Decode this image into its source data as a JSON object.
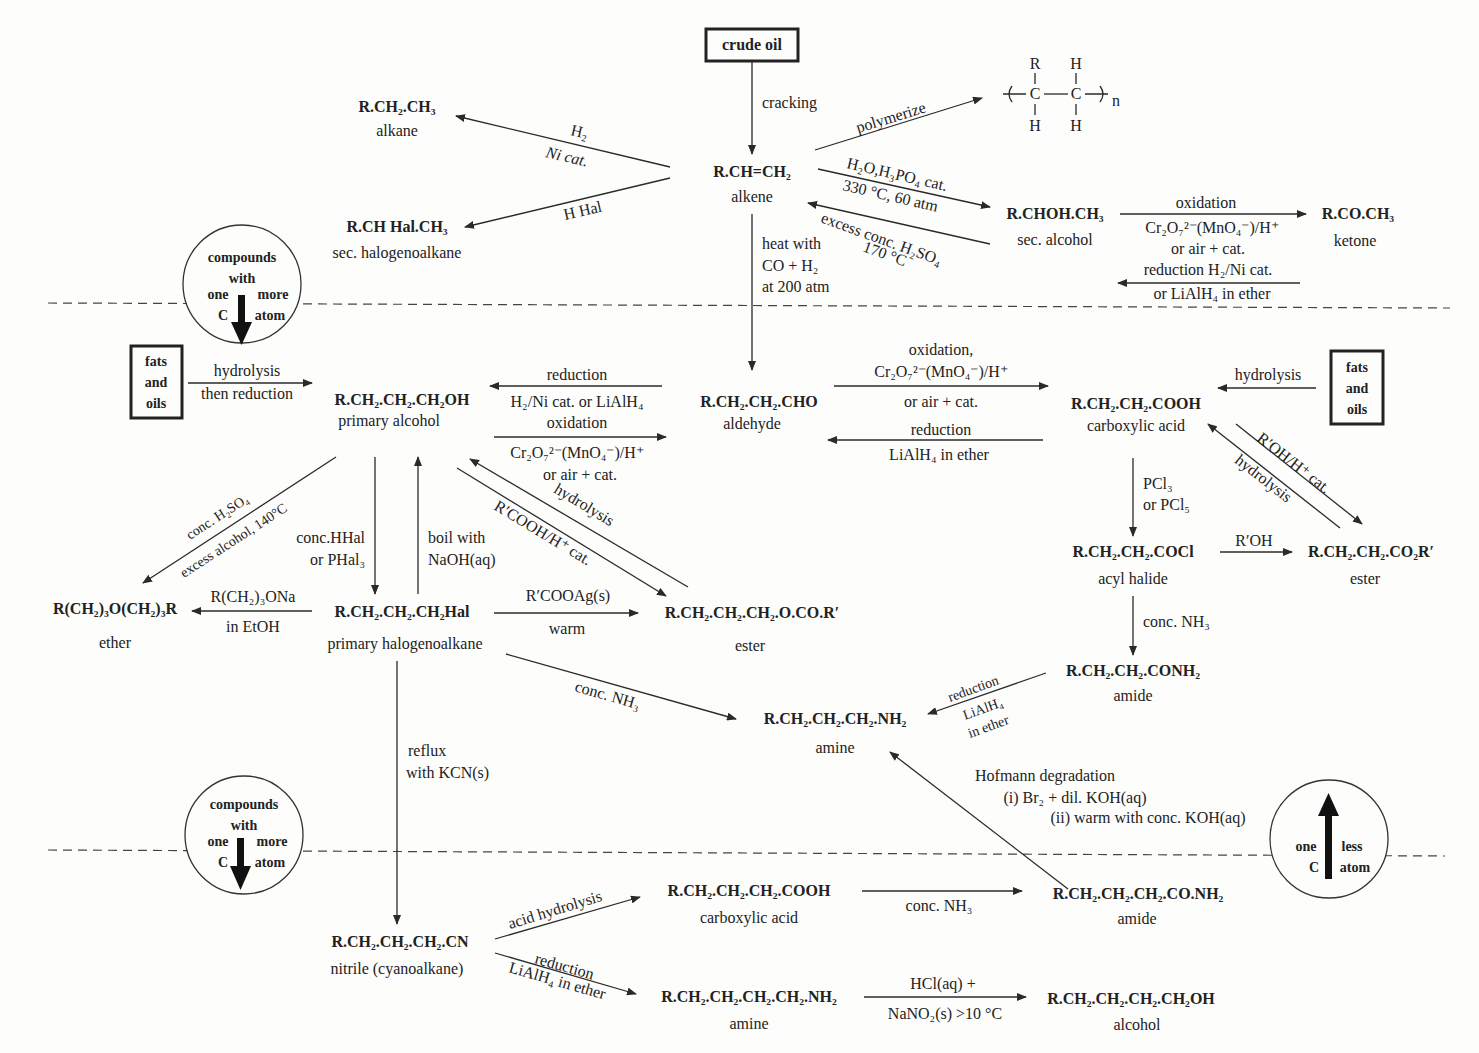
{
  "sources": {
    "crude_oil": "crude oil",
    "fats_oils_left": [
      "fats",
      "and",
      "oils"
    ],
    "fats_oils_right": [
      "fats",
      "and",
      "oils"
    ]
  },
  "compounds": {
    "alkene": {
      "formula": "R.CH=CH₂",
      "name": "alkene"
    },
    "alkane": {
      "formula": "R.CH₂.CH₃",
      "name": "alkane"
    },
    "sec_haloalkane": {
      "formula": "R.CH Hal.CH₃",
      "name": "sec. halogenoalkane"
    },
    "polymer": {
      "top": [
        "R",
        "H"
      ],
      "mid": "—C—C—",
      "bottom": [
        "H",
        "H"
      ],
      "n": "n"
    },
    "sec_alcohol": {
      "formula": "R.CHOH.CH₃",
      "name": "sec. alcohol"
    },
    "ketone": {
      "formula": "R.CO.CH₃",
      "name": "ketone"
    },
    "primary_alcohol": {
      "formula": "R.CH₂.CH₂.CH₂OH",
      "name": "primary alcohol"
    },
    "aldehyde": {
      "formula": "R.CH₂.CH₂.CHO",
      "name": "aldehyde"
    },
    "carboxylic_acid": {
      "formula": "R.CH₂.CH₂.COOH",
      "name": "carboxylic acid"
    },
    "ether": {
      "formula": "R(CH₂)₃O(CH₂)₃R",
      "name": "ether"
    },
    "primary_haloalkane": {
      "formula": "R.CH₂.CH₂.CH₂Hal",
      "name": "primary halogenoalkane"
    },
    "ester_left": {
      "formula": "R.CH₂.CH₂.CH₂.O.CO.R′",
      "name": "ester"
    },
    "acyl_halide": {
      "formula": "R.CH₂.CH₂.COCl",
      "name": "acyl halide"
    },
    "ester_right": {
      "formula": "R.CH₂.CH₂.CO₂R′",
      "name": "ester"
    },
    "amide_mid": {
      "formula": "R.CH₂.CH₂.CONH₂",
      "name": "amide"
    },
    "amine_mid": {
      "formula": "R.CH₂.CH₂.CH₂.NH₂",
      "name": "amine"
    },
    "nitrile": {
      "formula": "R.CH₂.CH₂.CH₂.CN",
      "name": "nitrile (cyanoalkane)"
    },
    "carboxylic_acid_low": {
      "formula": "R.CH₂.CH₂.CH₂.COOH",
      "name": "carboxylic acid"
    },
    "amide_low": {
      "formula": "R.CH₂.CH₂.CH₂.CO.NH₂",
      "name": "amide"
    },
    "amine_low": {
      "formula": "R.CH₂.CH₂.CH₂.CH₂.NH₂",
      "name": "amine"
    },
    "alcohol_low": {
      "formula": "R.CH₂.CH₂.CH₂.CH₂OH",
      "name": "alcohol"
    }
  },
  "reactions": {
    "cracking": "cracking",
    "polymerize": "polymerize",
    "hydrogenation": [
      "H₂",
      "Ni cat."
    ],
    "hhal": "H Hal",
    "hydration": [
      "H₂O,H₃PO₄ cat.",
      "330 °C, 60 atm"
    ],
    "dehydration": [
      "excess conc. H₂SO₄",
      "170 °C"
    ],
    "sec_oxidation": [
      "oxidation",
      "Cr₂O₇²⁻(MnO₄⁻)/H⁺",
      "or air + cat."
    ],
    "ketone_reduction": [
      "reduction H₂/Ni cat.",
      "or LiAlH₄ in ether"
    ],
    "hydroformylation": [
      "heat with",
      "CO + H₂",
      "at 200 atm"
    ],
    "fats_hydrolysis_reduction": [
      "hydrolysis",
      "then reduction"
    ],
    "aldehyde_reduction": [
      "reduction",
      "H₂/Ni cat. or LiAlH₄"
    ],
    "alcohol_oxidation": [
      "oxidation",
      "Cr₂O₇²⁻(MnO₄⁻)/H⁺",
      "or air + cat."
    ],
    "aldehyde_oxidation": [
      "oxidation,",
      "Cr₂O₇²⁻(MnO₄⁻)/H⁺",
      "or air + cat."
    ],
    "acid_reduction": [
      "reduction",
      "LiAlH₄ in ether"
    ],
    "fats_hydrolysis": "hydrolysis",
    "esterification_right": "R′OH/H⁺ cat.",
    "ester_hydrolysis_right": "hydrolysis",
    "pcl": [
      "PCl₃",
      "or PCl₅"
    ],
    "acyl_roh": "R′OH",
    "acyl_nh3": "conc. NH₃",
    "ether_formation": [
      "conc. H₂SO₄",
      "excess alcohol, 140°C"
    ],
    "halogenation": [
      "conc.HHal",
      "or PHal₃"
    ],
    "haloalkane_hydrolysis": [
      "boil with",
      "NaOH(aq)"
    ],
    "esterification_left": "R′COOH/H⁺ cat.",
    "ester_hydrolysis_left": "hydrolysis",
    "williamson": [
      "R(CH₂)₃ONa",
      "in EtOH"
    ],
    "silver_salt": [
      "R′COOAg(s)",
      "warm"
    ],
    "amination": "conc. NH₃",
    "amide_reduction": [
      "reduction",
      "LiAlH₄",
      "in ether"
    ],
    "hofmann": [
      "Hofmann degradation",
      "(i) Br₂ + dil. KOH(aq)",
      "(ii) warm with conc. KOH(aq)"
    ],
    "cyanide": [
      "reflux",
      "with KCN(s)"
    ],
    "acid_hydrolysis": "acid hydrolysis",
    "nitrile_reduction": [
      "reduction",
      "LiAlH₄ in ether"
    ],
    "acid_nh3": "conc. NH₃",
    "diazotization": [
      "HCl(aq) +",
      "NaNO₂(s) >10 °C"
    ]
  },
  "badges": {
    "more_top": {
      "lines": [
        "compounds",
        "with"
      ],
      "left": [
        "one",
        "C"
      ],
      "right": [
        "more",
        "atom"
      ]
    },
    "more_bottom": {
      "lines": [
        "compounds",
        "with"
      ],
      "left": [
        "one",
        "C"
      ],
      "right": [
        "more",
        "atom"
      ]
    },
    "less": {
      "left": [
        "one",
        "C"
      ],
      "right": [
        "less",
        "atom"
      ]
    }
  }
}
